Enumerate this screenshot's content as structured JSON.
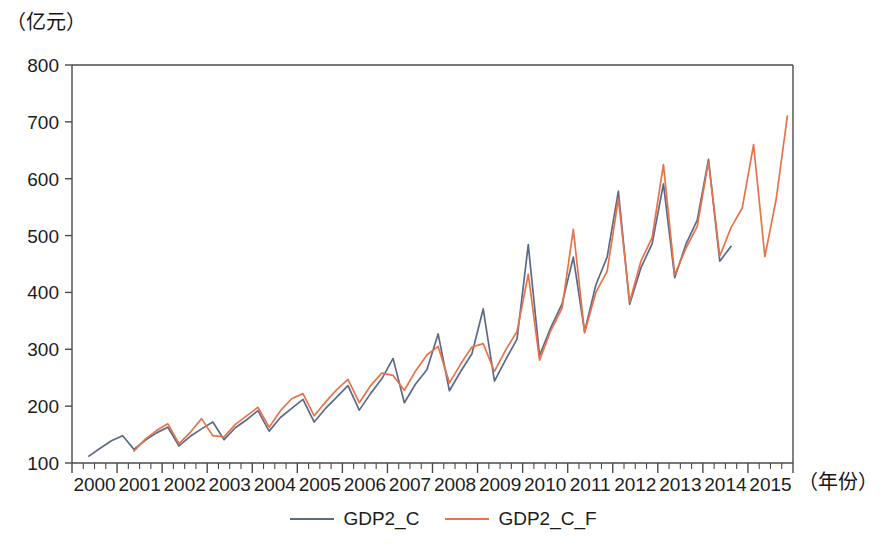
{
  "chart_data": {
    "type": "line",
    "title": "",
    "subtitle": "",
    "xlabel": "（年份）",
    "ylabel": "（亿元）",
    "xlim": [
      1999.5,
      2015.5
    ],
    "ylim": [
      100,
      800
    ],
    "ytick_values": [
      100,
      200,
      300,
      400,
      500,
      600,
      700,
      800
    ],
    "ytick_labels": [
      "100",
      "200",
      "300",
      "400",
      "500",
      "600",
      "700",
      "800"
    ],
    "xtick_labels": [
      "2000",
      "2001",
      "2002",
      "2003",
      "2004",
      "2005",
      "2006",
      "2007",
      "2008",
      "2009",
      "2010",
      "2011",
      "2012",
      "2013",
      "2014",
      "2015"
    ],
    "xtick_values": [
      2000,
      2001,
      2002,
      2003,
      2004,
      2005,
      2006,
      2007,
      2008,
      2009,
      2010,
      2011,
      2012,
      2013,
      2014,
      2015
    ],
    "minor_ticks_per_year": 4,
    "grid": false,
    "legend_position": "bottom-center",
    "frequency": "quarterly",
    "series": [
      {
        "name": "GDP2_C",
        "color": "#5c6a88",
        "x": [
          1999.875,
          2000.125,
          2000.375,
          2000.625,
          2000.875,
          2001.125,
          2001.375,
          2001.625,
          2001.875,
          2002.125,
          2002.375,
          2002.625,
          2002.875,
          2003.125,
          2003.375,
          2003.625,
          2003.875,
          2004.125,
          2004.375,
          2004.625,
          2004.875,
          2005.125,
          2005.375,
          2005.625,
          2005.875,
          2006.125,
          2006.375,
          2006.625,
          2006.875,
          2007.125,
          2007.375,
          2007.625,
          2007.875,
          2008.125,
          2008.375,
          2008.625,
          2008.875,
          2009.125,
          2009.375,
          2009.625,
          2009.875,
          2010.125,
          2010.375,
          2010.625,
          2010.875,
          2011.125,
          2011.375,
          2011.625,
          2011.875,
          2012.125,
          2012.375,
          2012.625,
          2012.875,
          2013.125,
          2013.375,
          2013.625,
          2013.875,
          2014.125
        ],
        "values": [
          112,
          126,
          139,
          148,
          124,
          140,
          153,
          163,
          130,
          147,
          160,
          172,
          141,
          162,
          176,
          192,
          156,
          180,
          196,
          212,
          172,
          196,
          216,
          236,
          193,
          222,
          248,
          284,
          206,
          239,
          264,
          327,
          227,
          261,
          292,
          371,
          244,
          282,
          318,
          484,
          289,
          338,
          380,
          462,
          331,
          413,
          462,
          578,
          379,
          443,
          486,
          591,
          426,
          485,
          527,
          634,
          455,
          481
        ]
      },
      {
        "name": "GDP2_C_F",
        "color": "#e8734a",
        "x": [
          2000.875,
          2001.125,
          2001.375,
          2001.625,
          2001.875,
          2002.125,
          2002.375,
          2002.625,
          2002.875,
          2003.125,
          2003.375,
          2003.625,
          2003.875,
          2004.125,
          2004.375,
          2004.625,
          2004.875,
          2005.125,
          2005.375,
          2005.625,
          2005.875,
          2006.125,
          2006.375,
          2006.625,
          2006.875,
          2007.125,
          2007.375,
          2007.625,
          2007.875,
          2008.125,
          2008.375,
          2008.625,
          2008.875,
          2009.125,
          2009.375,
          2009.625,
          2009.875,
          2010.125,
          2010.375,
          2010.625,
          2010.875,
          2011.125,
          2011.375,
          2011.625,
          2011.875,
          2012.125,
          2012.375,
          2012.625,
          2012.875,
          2013.125,
          2013.375,
          2013.625,
          2013.875,
          2014.125,
          2014.375,
          2014.625,
          2014.875,
          2015.125,
          2015.375
        ],
        "values": [
          121,
          142,
          157,
          169,
          134,
          154,
          178,
          148,
          146,
          168,
          183,
          198,
          163,
          192,
          213,
          222,
          183,
          207,
          229,
          247,
          206,
          236,
          258,
          254,
          228,
          262,
          290,
          305,
          241,
          274,
          304,
          310,
          261,
          299,
          331,
          432,
          281,
          333,
          372,
          511,
          329,
          400,
          437,
          565,
          383,
          455,
          497,
          625,
          431,
          478,
          516,
          630,
          464,
          514,
          549,
          660,
          463,
          563,
          710
        ]
      }
    ]
  },
  "axis_titles": {
    "y": "（亿元）",
    "x": "（年份）"
  },
  "legend": {
    "items": [
      {
        "label": "GDP2_C",
        "color": "#5c6a88"
      },
      {
        "label": "GDP2_C_F",
        "color": "#e8734a"
      }
    ]
  }
}
